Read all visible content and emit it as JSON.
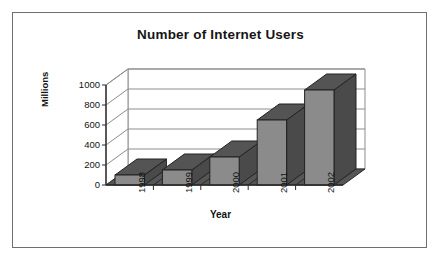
{
  "figure": {
    "frame_border_color": "#6f6f6f",
    "background": "#ffffff"
  },
  "chart_data": {
    "type": "bar",
    "title": "Number of Internet Users",
    "xlabel": "Year",
    "ylabel": "Millions",
    "categories": [
      "1998",
      "1999",
      "2000",
      "2001",
      "2002"
    ],
    "values": [
      100,
      150,
      280,
      650,
      950
    ],
    "ylim": [
      0,
      1000
    ],
    "yticks": [
      0,
      200,
      400,
      600,
      800,
      1000
    ],
    "ytick_labels": [
      "0",
      "200",
      "400",
      "600",
      "800",
      "1000"
    ],
    "grid": true,
    "grid_axis": "y",
    "legend": null,
    "style": "3d-column",
    "bar_front_color": "#8b8b8b",
    "bar_side_color": "#4a4a4a",
    "bar_top_color": "#545454",
    "floor_color": "#565656",
    "wall_color": "#ffffff",
    "axis_color": "#2a2a2a",
    "grid_color": "#8d8d8d"
  }
}
